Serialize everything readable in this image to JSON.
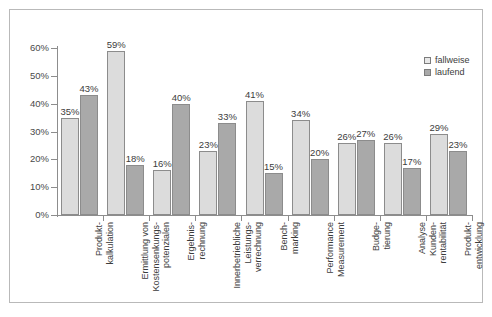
{
  "chart_data": {
    "type": "bar",
    "title": "",
    "xlabel": "",
    "ylabel": "",
    "ylim": [
      0,
      60
    ],
    "ytick_labels": [
      "0%",
      "10%",
      "20%",
      "30%",
      "40%",
      "50%",
      "60%"
    ],
    "ytick_values": [
      0,
      10,
      20,
      30,
      40,
      50,
      60
    ],
    "grid": false,
    "legend_position": "top-right",
    "value_suffix": "%",
    "categories": [
      "Produkt-\nkalkulation",
      "Ermittlung von\nKostensenkungs-\npotenzialen",
      "Ergebnis-\nrechnung",
      "Innerbetriebliche\nLeistungs-\nverrechnung",
      "Bench-\nmarking",
      "Performance\nMeasurement",
      "Budge-\ntierung",
      "Analyse\nKunden-\nrentabilität",
      "Produkt-\nentwicklung"
    ],
    "series": [
      {
        "name": "fallweise",
        "color": "#dcdcdc",
        "values": [
          35,
          59,
          16,
          23,
          41,
          34,
          26,
          26,
          29
        ],
        "labels": [
          "35%",
          "59%",
          "16%",
          "23%",
          "41%",
          "34%",
          "26%",
          "26%",
          "29%"
        ]
      },
      {
        "name": "laufend",
        "color": "#a9a9a9",
        "values": [
          43,
          18,
          40,
          33,
          15,
          20,
          27,
          17,
          23
        ],
        "labels": [
          "43%",
          "18%",
          "40%",
          "33%",
          "15%",
          "20%",
          "27%",
          "17%",
          "23%"
        ]
      }
    ]
  },
  "legend": {
    "items": [
      {
        "label": "fallweise",
        "swatch": "fallweise"
      },
      {
        "label": "laufend",
        "swatch": "laufend"
      }
    ]
  }
}
